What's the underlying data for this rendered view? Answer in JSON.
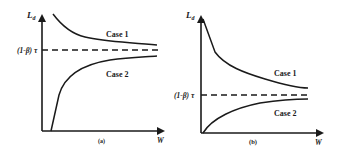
{
  "panels": [
    {
      "id": "a",
      "caption": "(a)",
      "y_label": "L",
      "y_label_sub": "d",
      "x_label": "W",
      "threshold_label": "(1-β) τ",
      "curves": [
        {
          "name": "Case 1",
          "label": "Case 1",
          "behavior": "decreasing, asymptotically approaches threshold from above"
        },
        {
          "name": "Case 2",
          "label": "Case 2",
          "behavior": "starts at zero after offset, rises steeply then asymptotically approaches threshold from below"
        }
      ]
    },
    {
      "id": "b",
      "caption": "(b)",
      "y_label": "L",
      "y_label_sub": "d",
      "x_label": "W",
      "threshold_label": "(1-β) τ",
      "curves": [
        {
          "name": "Case 1",
          "label": "Case 1",
          "behavior": "steep linear drop then decreasing, approaches threshold from above"
        },
        {
          "name": "Case 2",
          "label": "Case 2",
          "behavior": "starts at origin, increases concavely, approaches threshold from below"
        }
      ]
    }
  ]
}
